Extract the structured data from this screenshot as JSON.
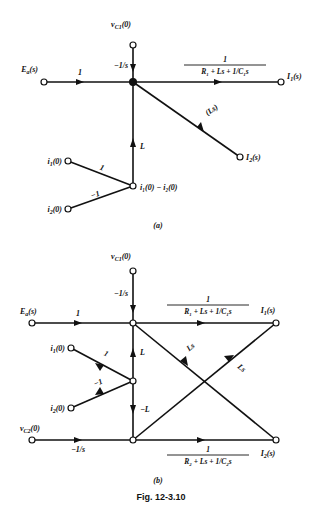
{
  "figure": {
    "caption": "Fig. 12-3.10",
    "panels": [
      {
        "id": "a",
        "label": "(a)"
      },
      {
        "id": "b",
        "label": "(b)"
      }
    ]
  },
  "panel_a": {
    "nodes": {
      "vc1": "v",
      "vc1_sub": "C1",
      "vc1_tail": "(0)",
      "ea": "E",
      "ea_sub": "a",
      "ea_tail": "(s)",
      "i1": "I",
      "i1_sub": "1",
      "i1_tail": "(s)",
      "i2": "I",
      "i2_sub": "2",
      "i2_tail": "(s)",
      "i10": "i",
      "i10_sub": "1",
      "i10_tail": "(0)",
      "i20": "i",
      "i20_sub": "2",
      "i20_tail": "(0)",
      "sum_node": "i₁(0) − i₂(0)"
    },
    "gains": {
      "vc1_to_junction": "−1/s",
      "ea_to_junction": "1",
      "junction_to_i1_num": "1",
      "junction_to_i1_den": "R₁ + Ls + 1/C₁s",
      "i2_to_junction": "(Ls)",
      "sum_to_junction": "L",
      "i10_to_sum": "1",
      "i20_to_sum": "−1"
    }
  },
  "panel_b": {
    "nodes": {
      "vc1": "v",
      "vc1_sub": "C1",
      "vc1_tail": "(0)",
      "vc2": "v",
      "vc2_sub": "C2",
      "vc2_tail": "(0)",
      "ea": "E",
      "ea_sub": "a",
      "ea_tail": "(s)",
      "i1": "I",
      "i1_sub": "1",
      "i1_tail": "(s)",
      "i2": "I",
      "i2_sub": "2",
      "i2_tail": "(s)",
      "i10": "i",
      "i10_sub": "1",
      "i10_tail": "(0)",
      "i20": "i",
      "i20_sub": "2",
      "i20_tail": "(0)"
    },
    "gains": {
      "vc1_to_top": "−1/s",
      "ea_to_top": "1",
      "top_to_i1_num": "1",
      "top_to_i1_den": "R₁ + Ls + 1/C₁s",
      "vc2_to_bottom": "−1/s",
      "bottom_to_i2_num": "1",
      "bottom_to_i2_den": "R₂ + Ls + 1/C₂s",
      "mid_to_top": "L",
      "mid_to_bottom": "−L",
      "i10_to_mid": "1",
      "i20_to_mid": "−1",
      "i2_to_top_diag": "Ls",
      "i1_to_bottom_diag": "Ls"
    }
  }
}
